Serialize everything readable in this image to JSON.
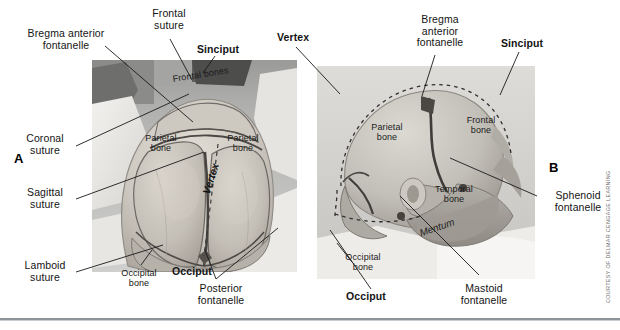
{
  "figure": {
    "credit": "COURTESY OF DELMAR CENGAGE LEARNING",
    "panels": [
      {
        "letter": "A",
        "view": "Vertex (top) view of newborn head",
        "photo_labels": [
          {
            "text": "Frontal bones"
          },
          {
            "text": "Parietal\nbone"
          },
          {
            "text": "Parietal\nbone"
          },
          {
            "text": "Vertex"
          },
          {
            "text": "Occipital\nbone"
          }
        ],
        "callouts": [
          {
            "text": "Bregma anterior\nfontanelle"
          },
          {
            "text": "Frontal\nsuture"
          },
          {
            "text": "Sinciput"
          },
          {
            "text": "Coronal\nsuture"
          },
          {
            "text": "Sagittal\nsuture"
          },
          {
            "text": "Lamboid\nsuture"
          },
          {
            "text": "Occiput"
          },
          {
            "text": "Posterior\nfontanelle"
          }
        ]
      },
      {
        "letter": "B",
        "view": "Lateral (side) view of newborn head",
        "photo_labels": [
          {
            "text": "Parietal\nbone"
          },
          {
            "text": "Frontal\nbone"
          },
          {
            "text": "Temporal\nbone"
          },
          {
            "text": "Occipital\nbone"
          },
          {
            "text": "Mentum"
          }
        ],
        "callouts": [
          {
            "text": "Vertex"
          },
          {
            "text": "Bregma\nanterior\nfontanelle"
          },
          {
            "text": "Sinciput"
          },
          {
            "text": "Sphenoid\nfontanelle"
          },
          {
            "text": "Mastoid\nfontanelle"
          },
          {
            "text": "Occiput"
          }
        ]
      }
    ]
  },
  "labels": {
    "a_letter": "A",
    "b_letter": "B",
    "bregma_anterior_fontanelle_a": "Bregma anterior\nfontanelle",
    "frontal_suture": "Frontal\nsuture",
    "sinciput_a": "Sinciput",
    "coronal_suture": "Coronal\nsuture",
    "sagittal_suture": "Sagittal\nsuture",
    "lamboid_suture": "Lamboid\nsuture",
    "frontal_bones": "Frontal bones",
    "parietal_bone_left": "Parietal\nbone",
    "parietal_bone_right": "Parietal\nbone",
    "vertex_a": "Vertex",
    "occipital_bone_a": "Occipital\nbone",
    "occiput_a": "Occiput",
    "posterior_fontanelle": "Posterior\nfontanelle",
    "vertex_b": "Vertex",
    "bregma_anterior_fontanelle_b": "Bregma\nanterior\nfontanelle",
    "sinciput_b": "Sinciput",
    "parietal_bone_b": "Parietal\nbone",
    "frontal_bone_b": "Frontal\nbone",
    "temporal_bone_b": "Temporal\nbone",
    "mentum": "Mentum",
    "occipital_bone_b": "Occipital\nbone",
    "occiput_b": "Occiput",
    "sphenoid_fontanelle": "Sphenoid\nfontanelle",
    "mastoid_fontanelle": "Mastoid\nfontanelle",
    "credit": "COURTESY OF DELMAR CENGAGE LEARNING"
  },
  "colors": {
    "text": "#141414",
    "leader_line": "#1a1a1a",
    "rule_dark": "#8f949a",
    "rule_light": "#c9ced3",
    "photo_background": "#c9c9c7",
    "skull_light": "#d9d7d2",
    "skull_mid": "#b9b6b0",
    "skull_shadow": "#8d8a85",
    "suture_dark": "#4a4744"
  }
}
